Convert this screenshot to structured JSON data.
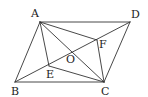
{
  "diagram": {
    "type": "geometry",
    "shape": "parallelogram ABCD",
    "points": [
      {
        "id": "A",
        "label": "A",
        "x": 40,
        "y": 22,
        "lx": 31,
        "ly": 17
      },
      {
        "id": "D",
        "label": "D",
        "x": 130,
        "y": 22,
        "lx": 131,
        "ly": 18
      },
      {
        "id": "B",
        "label": "B",
        "x": 15,
        "y": 82,
        "lx": 11,
        "ly": 95
      },
      {
        "id": "C",
        "label": "C",
        "x": 104,
        "y": 82,
        "lx": 101,
        "ly": 95
      },
      {
        "id": "O",
        "label": "O",
        "x": 72,
        "y": 52,
        "lx": 66,
        "ly": 63
      },
      {
        "id": "E",
        "label": "E",
        "x": 49,
        "y": 66,
        "lx": 46,
        "ly": 78
      },
      {
        "id": "F",
        "label": "F",
        "x": 97,
        "y": 40,
        "lx": 99,
        "ly": 48
      }
    ],
    "segments": [
      [
        "A",
        "D"
      ],
      [
        "D",
        "C"
      ],
      [
        "C",
        "B"
      ],
      [
        "B",
        "A"
      ],
      [
        "A",
        "C"
      ],
      [
        "B",
        "D"
      ],
      [
        "A",
        "E"
      ],
      [
        "E",
        "C"
      ],
      [
        "A",
        "F"
      ],
      [
        "F",
        "C"
      ]
    ]
  }
}
